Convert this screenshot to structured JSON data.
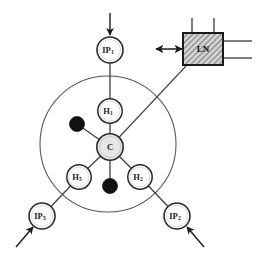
{
  "figure": {
    "kind": "molecular-mechanism-diagram",
    "background_color": "#ffffff",
    "line_color": "#3a3a3a",
    "dark_line_color": "#1a1a1a",
    "membrane_circle": {
      "label": "membrane-boundary-circle",
      "cx": 108,
      "cy": 144,
      "r": 68,
      "stroke": "#555555",
      "fill": "none"
    },
    "atoms": {
      "center": {
        "id": "C",
        "label": "C",
        "subscript": "",
        "cx": 110,
        "cy": 147,
        "r": 13,
        "fill": "#e6e6e6",
        "stroke": "#2b2b2b"
      },
      "hydrogens": [
        {
          "id": "H1",
          "label": "H",
          "subscript": "1",
          "cx": 110,
          "cy": 111,
          "r": 12,
          "fill": "#ffffff",
          "stroke": "#2b2b2b"
        },
        {
          "id": "H2",
          "label": "H",
          "subscript": "2",
          "cx": 140,
          "cy": 177,
          "r": 12,
          "fill": "#ffffff",
          "stroke": "#2b2b2b"
        },
        {
          "id": "H5",
          "label": "H",
          "subscript": "5",
          "cx": 79,
          "cy": 177,
          "r": 12,
          "fill": "#ffffff",
          "stroke": "#2b2b2b"
        }
      ],
      "filled_atoms": [
        {
          "id": "dot-upper-left",
          "cx": 77,
          "cy": 124,
          "r": 7.5,
          "fill": "#111111"
        },
        {
          "id": "dot-bottom",
          "cx": 110,
          "cy": 186,
          "r": 7.5,
          "fill": "#111111"
        }
      ]
    },
    "ip_nodes": [
      {
        "id": "IP1",
        "label": "IP",
        "subscript": "1",
        "cx": 110,
        "cy": 50,
        "r": 13,
        "fill": "#ffffff",
        "stroke": "#2b2b2b"
      },
      {
        "id": "IP2",
        "label": "IP",
        "subscript": "2",
        "cx": 177,
        "cy": 216,
        "r": 13,
        "fill": "#ffffff",
        "stroke": "#2b2b2b"
      },
      {
        "id": "IP5",
        "label": "IP",
        "subscript": "5",
        "cx": 42,
        "cy": 216,
        "r": 13,
        "fill": "#ffffff",
        "stroke": "#2b2b2b"
      }
    ],
    "ln_box": {
      "id": "LN",
      "label": "LN",
      "x": 183,
      "y": 33,
      "width": 40,
      "height": 32,
      "fill": "#cfcfcf",
      "stroke": "#1a1a1a",
      "hatch": "diagonal",
      "top_stems": 2,
      "right_leads": 2
    },
    "bonds": [
      {
        "name": "bond-C-H1",
        "from": "C",
        "to": "H1"
      },
      {
        "name": "bond-C-H2",
        "from": "C",
        "to": "H2"
      },
      {
        "name": "bond-C-H5",
        "from": "C",
        "to": "H5"
      },
      {
        "name": "bond-C-dot-upper-left",
        "from": "C",
        "to": "dot-upper-left"
      },
      {
        "name": "bond-C-dot-bottom",
        "from": "C",
        "to": "dot-bottom"
      },
      {
        "name": "bond-H1-IP1",
        "from": "H1",
        "to": "IP1"
      },
      {
        "name": "bond-H2-IP2",
        "from": "H2",
        "to": "IP2"
      },
      {
        "name": "bond-H5-IP5",
        "from": "H5",
        "to": "IP5"
      },
      {
        "name": "bond-C-LN",
        "from": "C",
        "to": "LN"
      }
    ],
    "arrows": [
      {
        "name": "input-arrow-ip1",
        "label": "inflow into IP1",
        "direction": "down",
        "x1": 110,
        "y1": 13,
        "x2": 110,
        "y2": 34
      },
      {
        "name": "input-arrow-ip5",
        "label": "inflow into IP5",
        "direction": "up-right",
        "x1": 18,
        "y1": 246,
        "x2": 33,
        "y2": 227
      },
      {
        "name": "input-arrow-ip2",
        "label": "inflow into IP2",
        "direction": "up-left",
        "x1": 202,
        "y1": 246,
        "x2": 187,
        "y2": 227
      },
      {
        "name": "double-arrow-ln",
        "label": "bidirectional LN coupling",
        "direction": "both",
        "x1": 154,
        "y1": 49,
        "x2": 183,
        "y2": 49
      }
    ]
  }
}
